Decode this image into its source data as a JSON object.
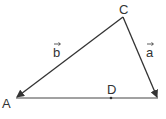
{
  "diagram": {
    "points": {
      "A": {
        "label": "A",
        "x": 16,
        "y": 98
      },
      "C": {
        "label": "C",
        "x": 123,
        "y": 17
      },
      "B": {
        "x": 158,
        "y": 98
      },
      "D": {
        "label": "D",
        "x": 111,
        "y": 98
      }
    },
    "vectors": [
      {
        "name": "b",
        "label": "b",
        "from": "C",
        "to": "A"
      },
      {
        "name": "a",
        "label": "a",
        "from": "C",
        "to": "B"
      }
    ],
    "segments": [
      {
        "from": "A",
        "to": "B"
      }
    ],
    "stroke_color": "#333333"
  }
}
